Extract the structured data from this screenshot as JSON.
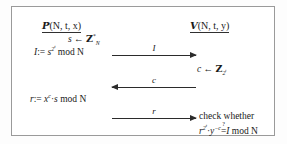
{
  "figure": {
    "kind": "cryptographic-protocol-diagram",
    "border_color": "#9a9a9a",
    "ink_color": "#1a1a1a",
    "background": "#ffffff"
  },
  "parties": {
    "prover": {
      "symbol": "P",
      "args": "(N, t, x)",
      "full": "P(N,t,x)"
    },
    "verifier": {
      "symbol": "V",
      "args": "(N, t, y)",
      "full": "V(N,t,y)"
    }
  },
  "prover_steps": {
    "sample_var": "s",
    "sample_arrow": "←",
    "sample_set": "Z",
    "sample_set_sub": "N",
    "sample_set_sup": "*",
    "commit_lhs": "I",
    "assign": ":=",
    "commit_base": "s",
    "commit_exp_base": "2",
    "commit_exp_exp": "t",
    "commit_mod": "mod N",
    "response_lhs": "r",
    "response_base": "x",
    "response_exp": "c",
    "response_dot": "·",
    "response_factor": "s",
    "response_mod": "mod N"
  },
  "verifier_steps": {
    "challenge_var": "c",
    "challenge_arrow": "←",
    "challenge_set": "Z",
    "challenge_set_sub_base": "2",
    "challenge_set_sub_exp": "t",
    "check_text": "check whether",
    "check_base": "r",
    "check_exp_base": "2",
    "check_exp_exp": "t",
    "check_dot": "·",
    "check_y": "y",
    "check_y_exp": "−c",
    "check_rel": "=",
    "check_rel_mark": "?",
    "check_rhs": "I",
    "check_mod": "mod N"
  },
  "messages": [
    {
      "label": "I",
      "direction": "prover-to-verifier"
    },
    {
      "label": "c",
      "direction": "verifier-to-prover"
    },
    {
      "label": "r",
      "direction": "prover-to-verifier"
    }
  ]
}
